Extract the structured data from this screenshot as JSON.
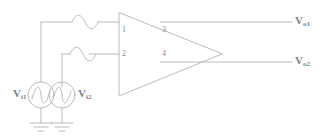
{
  "diagram": {
    "line_color": "#a9a9b0",
    "text_color": "#82828a",
    "background": "#ffffff"
  },
  "amplifier": {
    "name": "triangle-amplifier",
    "pins": [
      {
        "id": "pin-1",
        "number": "1",
        "side": "input"
      },
      {
        "id": "pin-2",
        "number": "2",
        "side": "input"
      },
      {
        "id": "pin-3",
        "number": "3",
        "side": "output"
      },
      {
        "id": "pin-4",
        "number": "4",
        "side": "output"
      }
    ]
  },
  "sources": [
    {
      "id": "source-1",
      "label_v": "V",
      "label_sub": "i1",
      "type": "ac-voltage-source",
      "symbol": "sine-wave-circle"
    },
    {
      "id": "source-2",
      "label_v": "V",
      "label_sub": "i2",
      "type": "ac-voltage-source",
      "symbol": "sine-wave-circle"
    }
  ],
  "outputs": [
    {
      "id": "output-1",
      "label_v": "V",
      "label_sub": "o1"
    },
    {
      "id": "output-2",
      "label_v": "V",
      "label_sub": "o2"
    }
  ],
  "wire_markers": [
    {
      "id": "sine-marker-1",
      "icon": "sine-wave-icon"
    },
    {
      "id": "sine-marker-2",
      "icon": "sine-wave-icon"
    }
  ],
  "grounds": [
    {
      "id": "ground-1",
      "icon": "ground-icon"
    },
    {
      "id": "ground-2",
      "icon": "ground-icon"
    }
  ]
}
